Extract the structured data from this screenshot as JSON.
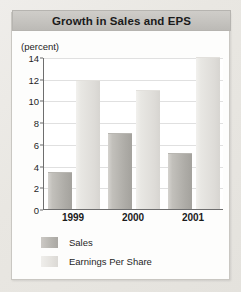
{
  "chart_data": {
    "type": "bar",
    "title": "Growth in Sales and EPS",
    "xlabel": "",
    "ylabel": "(percent)",
    "categories": [
      "1999",
      "2000",
      "2001"
    ],
    "series": [
      {
        "name": "Sales",
        "values": [
          3.4,
          7.0,
          5.2
        ],
        "color": "#b4b2ad"
      },
      {
        "name": "Earnings Per Share",
        "values": [
          11.9,
          11.0,
          14.0
        ],
        "color": "#e4e2de"
      }
    ],
    "ylim": [
      0,
      14
    ],
    "ytick_labels": [
      "0",
      "2",
      "4",
      "6",
      "8",
      "10",
      "12",
      "14"
    ],
    "ytick_values": [
      0,
      2,
      4,
      6,
      8,
      10,
      12,
      14
    ],
    "grid": true,
    "legend_position": "bottom-left"
  },
  "title": {
    "text": "Growth in Sales and EPS"
  },
  "axes": {
    "unit_caption": "(percent)"
  },
  "legend": {
    "entries": [
      {
        "label": "Sales"
      },
      {
        "label": "Earnings Per Share"
      }
    ]
  }
}
